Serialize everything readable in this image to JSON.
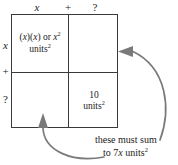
{
  "diagram": {
    "type": "area-model-grid",
    "colors": {
      "grid_line": "#3a3a3a",
      "arrow": "#7a7a7a",
      "text": "#1a1a1a",
      "background": "#ffffff"
    },
    "top_labels": [
      {
        "name": "top-term-1",
        "text": "x",
        "italic": true
      },
      {
        "name": "top-operator",
        "text": "+",
        "italic": false
      },
      {
        "name": "top-term-2",
        "text": "?",
        "italic": false
      }
    ],
    "left_labels": [
      {
        "name": "left-term-1",
        "text": "x",
        "italic": true
      },
      {
        "name": "left-operator",
        "text": "+",
        "italic": false
      },
      {
        "name": "left-term-2",
        "text": "?",
        "italic": false
      }
    ],
    "cells": [
      {
        "name": "cell-top-left",
        "position": "top-left",
        "line1_plain": "(x)(x) or x",
        "line1_prefix": "(",
        "line1_var1": "x",
        "line1_mid": ")(",
        "line1_var2": "x",
        "line1_connector": ") or ",
        "line1_var3": "x",
        "line1_exponent": "2",
        "line2_text": "units",
        "line2_exponent": "2"
      },
      {
        "name": "cell-top-right",
        "position": "top-right",
        "content": ""
      },
      {
        "name": "cell-bottom-left",
        "position": "bottom-left",
        "content": ""
      },
      {
        "name": "cell-bottom-right",
        "position": "bottom-right",
        "line1_text": "10",
        "line2_text": "units",
        "line2_exponent": "2"
      }
    ],
    "arrows": [
      {
        "name": "arrow-to-top-right-cell",
        "points_to": "cell-top-right",
        "direction": "left",
        "style": "curved"
      },
      {
        "name": "arrow-to-bottom-left-cell",
        "points_to": "cell-bottom-left",
        "direction": "up",
        "style": "curved"
      }
    ],
    "caption": {
      "name": "sum-annotation",
      "line1": "these must sum",
      "line2_prefix": "to 7",
      "line2_var": "x",
      "line2_suffix": " units",
      "line2_exponent": "2",
      "full_text": "these must sum to 7x units2"
    }
  }
}
